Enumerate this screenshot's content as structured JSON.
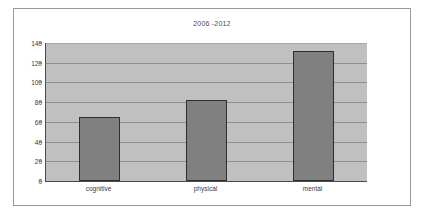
{
  "chart_data": {
    "type": "bar",
    "title": "2006 -2012",
    "xlabel": "",
    "ylabel": "",
    "categories": [
      "cognitive",
      "physical",
      "mental"
    ],
    "values": [
      65,
      82,
      132
    ],
    "ylim": [
      0,
      140
    ],
    "yticks": [
      0,
      20,
      40,
      60,
      80,
      100,
      120,
      140
    ],
    "ytick_labels": [
      "0",
      "20",
      "40",
      "60",
      "80",
      "100",
      "120",
      "140"
    ],
    "grid": true,
    "legend": "none",
    "colors": {
      "bar_fill": "#808080",
      "bar_border": "#2f2f2f",
      "plot_background": "#c0c0c0",
      "gridline": "#8f8f8f",
      "axis": "#4a4a4a",
      "frame_border": "#9a9a9a",
      "page_background": "#ffffff",
      "text": "#3a3a3a"
    }
  }
}
